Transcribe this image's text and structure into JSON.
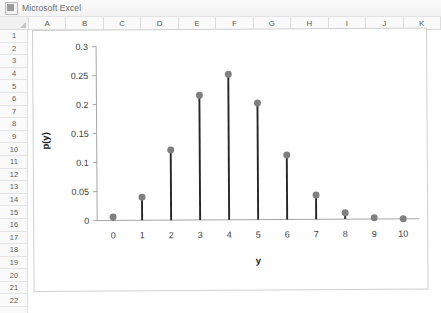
{
  "window": {
    "title": "Microsoft Excel",
    "icon": "excel-icon"
  },
  "spreadsheet": {
    "column_headers": [
      "A",
      "B",
      "C",
      "D",
      "E",
      "F",
      "G",
      "H",
      "I",
      "J",
      "K"
    ],
    "row_headers": [
      "1",
      "2",
      "3",
      "4",
      "5",
      "6",
      "7",
      "8",
      "9",
      "10",
      "11",
      "12",
      "13",
      "14",
      "15",
      "16",
      "17",
      "18",
      "19",
      "20",
      "21",
      "22"
    ]
  },
  "chart_data": {
    "type": "scatter",
    "title": "",
    "xlabel": "y",
    "ylabel": "p(y)",
    "xlim": [
      -0.55,
      10.55
    ],
    "ylim": [
      0,
      0.3
    ],
    "grid": false,
    "legend": false,
    "marker_color": "#808080",
    "stem_color": "#262626",
    "axis_color": "#a6a6a6",
    "x_ticks": [
      "0",
      "1",
      "2",
      "3",
      "4",
      "5",
      "6",
      "7",
      "8",
      "9",
      "10"
    ],
    "y_ticks": [
      "0",
      "0.05",
      "0.1",
      "0.15",
      "0.2",
      "0.25",
      "0.3"
    ],
    "y_tick_values": [
      0,
      0.05,
      0.1,
      0.15,
      0.2,
      0.25,
      0.3
    ],
    "x": [
      0,
      1,
      2,
      3,
      4,
      5,
      6,
      7,
      8,
      9,
      10
    ],
    "values": [
      0.006,
      0.04,
      0.121,
      0.215,
      0.251,
      0.201,
      0.111,
      0.042,
      0.011,
      0.002,
      0.0
    ]
  }
}
